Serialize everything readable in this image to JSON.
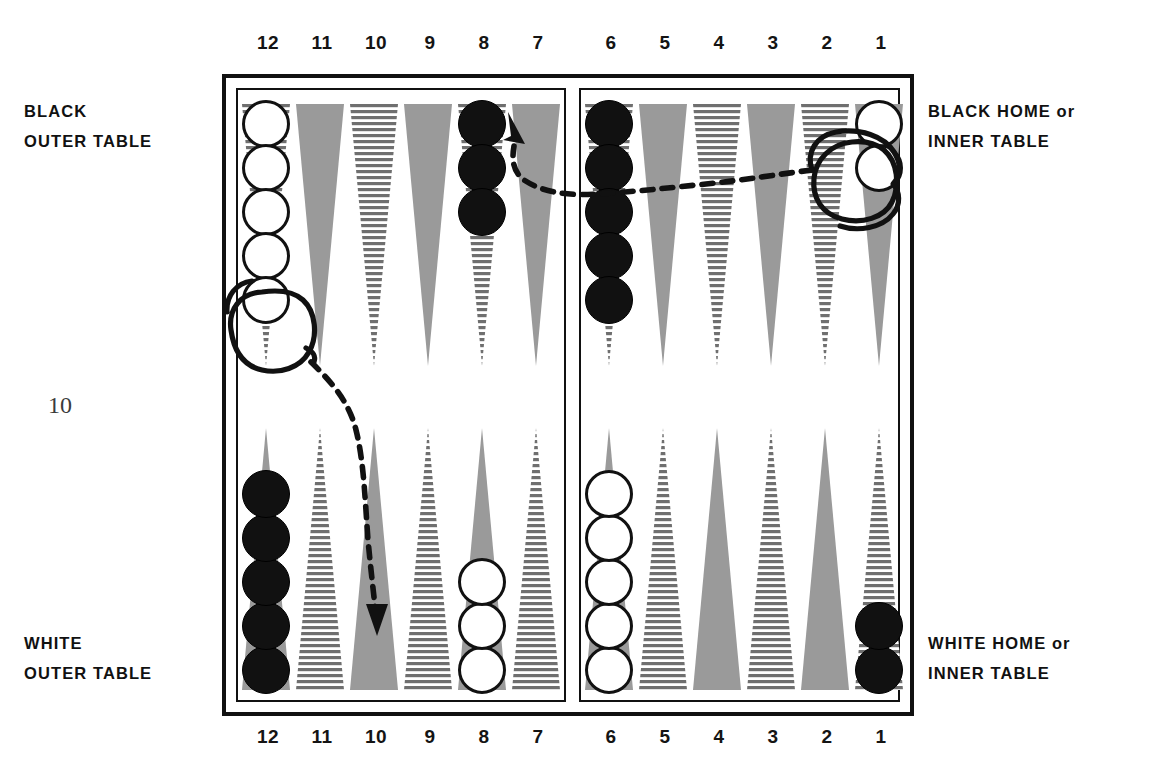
{
  "page": {
    "folio": "10"
  },
  "labels": {
    "top_left": {
      "line1": "BLACK",
      "line2": "OUTER TABLE"
    },
    "top_right": {
      "line1": "BLACK HOME or",
      "line2": "INNER TABLE"
    },
    "bottom_left": {
      "line1": "WHITE",
      "line2": "OUTER TABLE"
    },
    "bottom_right": {
      "line1": "WHITE HOME or",
      "line2": "INNER TABLE"
    }
  },
  "point_numbers": {
    "top": [
      "12",
      "11",
      "10",
      "9",
      "8",
      "7",
      "6",
      "5",
      "4",
      "3",
      "2",
      "1"
    ],
    "bottom": [
      "12",
      "11",
      "10",
      "9",
      "8",
      "7",
      "6",
      "5",
      "4",
      "3",
      "2",
      "1"
    ]
  },
  "board": {
    "quadrants": {
      "top_left_label": "black-outer-table",
      "top_right_label": "black-home-inner-table",
      "bottom_left_label": "white-outer-table",
      "bottom_right_label": "white-home-inner-table"
    },
    "colors": {
      "point_gray": "#9a9a9a",
      "point_stripe": "#6f6f6f",
      "checker_black": "#111111",
      "checker_white": "#ffffff",
      "frame": "#111111",
      "annotation": "#111111"
    },
    "points": [
      {
        "number": "12",
        "row": "top",
        "fill": "striped",
        "checker_color": "white",
        "count": 5
      },
      {
        "number": "11",
        "row": "top",
        "fill": "solid",
        "checker_color": "none",
        "count": 0
      },
      {
        "number": "10",
        "row": "top",
        "fill": "striped",
        "checker_color": "none",
        "count": 0
      },
      {
        "number": "9",
        "row": "top",
        "fill": "solid",
        "checker_color": "none",
        "count": 0
      },
      {
        "number": "8",
        "row": "top",
        "fill": "striped",
        "checker_color": "black",
        "count": 3
      },
      {
        "number": "7",
        "row": "top",
        "fill": "solid",
        "checker_color": "none",
        "count": 0
      },
      {
        "number": "6",
        "row": "top",
        "fill": "striped",
        "checker_color": "black",
        "count": 5
      },
      {
        "number": "5",
        "row": "top",
        "fill": "solid",
        "checker_color": "none",
        "count": 0
      },
      {
        "number": "4",
        "row": "top",
        "fill": "striped",
        "checker_color": "none",
        "count": 0
      },
      {
        "number": "3",
        "row": "top",
        "fill": "solid",
        "checker_color": "none",
        "count": 0
      },
      {
        "number": "2",
        "row": "top",
        "fill": "striped",
        "checker_color": "none",
        "count": 0
      },
      {
        "number": "1",
        "row": "top",
        "fill": "solid",
        "checker_color": "white",
        "count": 2
      },
      {
        "number": "12",
        "row": "bottom",
        "fill": "solid",
        "checker_color": "black",
        "count": 5
      },
      {
        "number": "11",
        "row": "bottom",
        "fill": "striped",
        "checker_color": "none",
        "count": 0
      },
      {
        "number": "10",
        "row": "bottom",
        "fill": "solid",
        "checker_color": "none",
        "count": 0
      },
      {
        "number": "9",
        "row": "bottom",
        "fill": "striped",
        "checker_color": "none",
        "count": 0
      },
      {
        "number": "8",
        "row": "bottom",
        "fill": "solid",
        "checker_color": "white",
        "count": 3
      },
      {
        "number": "7",
        "row": "bottom",
        "fill": "striped",
        "checker_color": "none",
        "count": 0
      },
      {
        "number": "6",
        "row": "bottom",
        "fill": "solid",
        "checker_color": "white",
        "count": 5
      },
      {
        "number": "5",
        "row": "bottom",
        "fill": "striped",
        "checker_color": "none",
        "count": 0
      },
      {
        "number": "4",
        "row": "bottom",
        "fill": "solid",
        "checker_color": "none",
        "count": 0
      },
      {
        "number": "3",
        "row": "bottom",
        "fill": "striped",
        "checker_color": "none",
        "count": 0
      },
      {
        "number": "2",
        "row": "bottom",
        "fill": "solid",
        "checker_color": "none",
        "count": 0
      },
      {
        "number": "1",
        "row": "bottom",
        "fill": "striped",
        "checker_color": "black",
        "count": 2
      }
    ]
  },
  "annotations": [
    {
      "name": "lasso-white-checker-top-12",
      "type": "hand-drawn-circle",
      "target_point": "12",
      "target_row": "top"
    },
    {
      "name": "lasso-white-checker-top-1",
      "type": "hand-drawn-circle",
      "target_point": "1",
      "target_row": "top"
    },
    {
      "name": "move-arrow-12-to-10",
      "type": "dashed-arrow",
      "from_point": "12",
      "from_row": "top",
      "to_point": "10",
      "to_row": "bottom"
    },
    {
      "name": "move-arrow-1-to-7",
      "type": "dashed-arrow",
      "from_point": "1",
      "from_row": "top",
      "to_point": "7",
      "to_row": "top"
    }
  ]
}
